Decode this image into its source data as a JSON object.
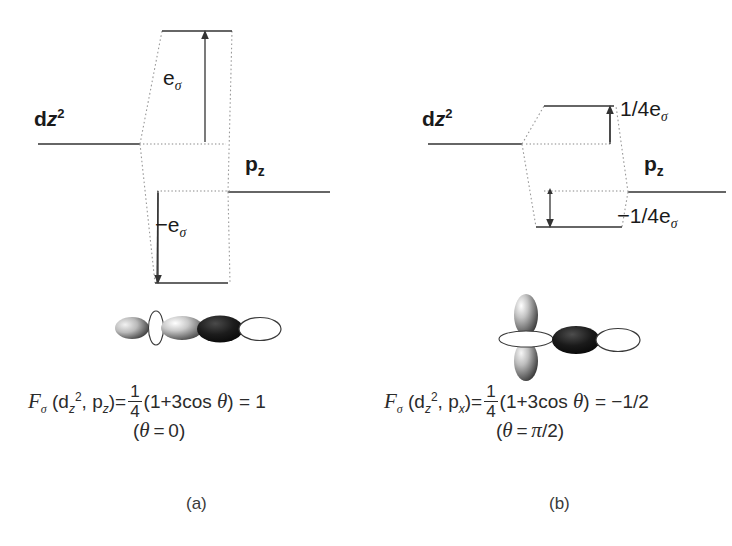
{
  "figure": {
    "background": "#ffffff",
    "line_color": "#333333",
    "dotted_color": "#888888"
  },
  "panels": [
    {
      "id": "a",
      "caption": "(a)",
      "left_level": {
        "label_d": "d",
        "label_z": "z",
        "label_sup": "2",
        "full": "dz2"
      },
      "right_level": {
        "label_p": "p",
        "label_sub": "z",
        "full": "pz"
      },
      "upper_energy": {
        "text": "e",
        "sub": "σ",
        "sign": "",
        "full": "eσ"
      },
      "lower_energy": {
        "text": "e",
        "sub": "σ",
        "sign": "−",
        "full": "−eσ"
      },
      "orbital_description": "dz2-sigma-pz-inline-overlap",
      "formula": {
        "F": "F",
        "F_sub": "σ",
        "args_open": "(d",
        "arg1_sub": "z",
        "arg1_sup": "2",
        "arg_comma": ", p",
        "arg2_sub": "z",
        "args_close": ")",
        "equals": "=",
        "frac_num": "1",
        "frac_den": "4",
        "paren": "(1+3cos",
        "theta": "θ",
        "paren_close": ")",
        "equals2": "=",
        "result": "1",
        "plain": "Fσ (dz2, pz) = 1/4 (1 + 3cos θ) = 1"
      },
      "angle_note": {
        "open": "(",
        "theta": "θ",
        "equals": "=",
        "value": "0",
        "close": ")",
        "plain": "(θ = 0)"
      }
    },
    {
      "id": "b",
      "caption": "(b)",
      "left_level": {
        "label_d": "d",
        "label_z": "z",
        "label_sup": "2",
        "full": "dz2"
      },
      "right_level": {
        "label_p": "p",
        "label_sub": "z",
        "full": "pz"
      },
      "upper_energy": {
        "text": "1/4e",
        "sub": "σ",
        "sign": "",
        "full": "1/4eσ"
      },
      "lower_energy": {
        "text": "1/4e",
        "sub": "σ",
        "sign": "−",
        "full": "−1/4eσ"
      },
      "orbital_description": "dz2-vertical-sigma-px-horizontal-overlap",
      "formula": {
        "F": "F",
        "F_sub": "σ",
        "args_open": "(d",
        "arg1_sub": "z",
        "arg1_sup": "2",
        "arg_comma": ", p",
        "arg2_sub": "x",
        "args_close": ")",
        "equals": "=",
        "frac_num": "1",
        "frac_den": "4",
        "paren": "(1+3cos",
        "theta": "θ",
        "paren_close": ")",
        "equals2": "=",
        "result": "−1/2",
        "plain": "Fσ (dz2, px) = 1/4 (1 + 3cos θ) = −1/2"
      },
      "angle_note": {
        "open": "(",
        "theta": "θ",
        "equals": "=",
        "value": "π/2",
        "close": ")",
        "plain": "(θ = π/2)"
      }
    }
  ]
}
